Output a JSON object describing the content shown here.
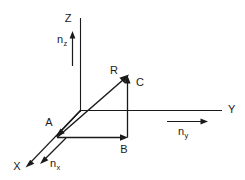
{
  "diagram": {
    "stroke_color": "#1a1a1a",
    "background_color": "#ffffff",
    "axes": [
      {
        "id": "x",
        "label": "X",
        "unit_vector_label": "n",
        "unit_vector_sub": "x"
      },
      {
        "id": "y",
        "label": "Y",
        "unit_vector_label": "n",
        "unit_vector_sub": "y"
      },
      {
        "id": "z",
        "label": "Z",
        "unit_vector_label": "n",
        "unit_vector_sub": "z"
      }
    ],
    "vector": {
      "label": "R"
    },
    "components": [
      {
        "id": "a",
        "label": "A"
      },
      {
        "id": "b",
        "label": "B"
      },
      {
        "id": "c",
        "label": "C"
      }
    ],
    "labels": {
      "z_axis": "Z",
      "y_axis": "Y",
      "x_axis": "X",
      "nz": "n",
      "nz_sub": "z",
      "ny": "n",
      "ny_sub": "y",
      "nx": "n",
      "nx_sub": "x",
      "vector_r": "R",
      "component_a": "A",
      "component_b": "B",
      "component_c": "C"
    }
  }
}
